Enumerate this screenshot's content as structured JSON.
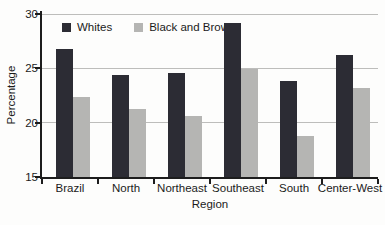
{
  "chart_data": {
    "type": "bar",
    "title": "",
    "categories": [
      "Brazil",
      "North",
      "Northeast",
      "Southeast",
      "South",
      "Center-West"
    ],
    "series": [
      {
        "name": "Whites",
        "color": "#2c2c34",
        "values": [
          26.8,
          24.4,
          24.6,
          29.2,
          23.8,
          26.2
        ]
      },
      {
        "name": "Black and Brown",
        "color": "#b5b5b3",
        "values": [
          22.4,
          21.3,
          20.6,
          24.9,
          18.8,
          23.2
        ]
      }
    ],
    "xlabel": "Region",
    "ylabel": "Percentage",
    "ylim": [
      15,
      30
    ],
    "yticks": [
      15,
      20,
      25,
      30
    ],
    "grid": "horizontal",
    "gridline_color": "#bdbdbb",
    "legend_position": "top-left-inside",
    "background_color": "#fdfdfc"
  }
}
